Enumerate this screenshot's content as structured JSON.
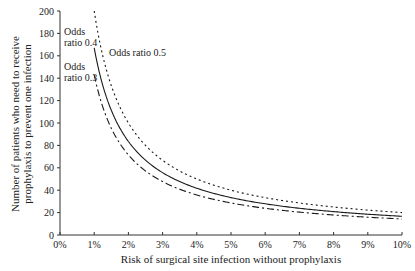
{
  "chart_data": {
    "type": "line",
    "title": "",
    "xlabel": "Risk of surgical site infection without prophylaxis",
    "ylabel_lines": [
      "Number of patients who need to receive",
      "prophylaxis to prevent one infection"
    ],
    "ylabel": "Number of patients who need to receive prophylaxis to prevent one infection",
    "xlim": [
      0,
      10
    ],
    "ylim": [
      0,
      200
    ],
    "x_ticks": [
      "0%",
      "1%",
      "2%",
      "3%",
      "4%",
      "5%",
      "6%",
      "7%",
      "8%",
      "9%",
      "10%"
    ],
    "y_ticks": [
      "0",
      "20",
      "40",
      "60",
      "80",
      "100",
      "120",
      "140",
      "160",
      "180",
      "200"
    ],
    "grid": false,
    "legend": "none (inline annotations)",
    "x": [
      1,
      1.5,
      2,
      2.5,
      3,
      4,
      5,
      6,
      7,
      8,
      9,
      10
    ],
    "series": [
      {
        "name": "Odds ratio 0.5",
        "style": "dotted",
        "values": [
          200,
          133,
          100,
          80,
          67,
          50,
          40,
          33,
          29,
          25,
          22,
          20
        ]
      },
      {
        "name": "Odds ratio 0.4",
        "style": "solid",
        "values": [
          167,
          111,
          83,
          67,
          56,
          42,
          33,
          28,
          24,
          21,
          19,
          17
        ]
      },
      {
        "name": "Odds ratio 0.3",
        "style": "dash-dot",
        "values": [
          143,
          95,
          71,
          57,
          48,
          36,
          29,
          24,
          20,
          18,
          16,
          14
        ]
      }
    ],
    "annotations": [
      {
        "text_lines": [
          "Odds",
          "ratio 0.4"
        ],
        "series": "Odds ratio 0.4"
      },
      {
        "text_lines": [
          "Odds",
          "ratio 0.3"
        ],
        "series": "Odds ratio 0.3"
      },
      {
        "text_lines": [
          "Odds ratio 0.5"
        ],
        "series": "Odds ratio 0.5"
      }
    ]
  },
  "labels": {
    "xlabel": "Risk of surgical site infection without prophylaxis",
    "ylabel_line1": "Number of patients who need to receive",
    "ylabel_line2": "prophylaxis to prevent one infection",
    "annot_04_line1": "Odds",
    "annot_04_line2": "ratio 0.4",
    "annot_03_line1": "Odds",
    "annot_03_line2": "ratio 0.3",
    "annot_05": "Odds ratio 0.5"
  },
  "colors": {
    "line": "#1a1a1a",
    "axis": "#333333",
    "text": "#222222",
    "background": "#ffffff"
  }
}
